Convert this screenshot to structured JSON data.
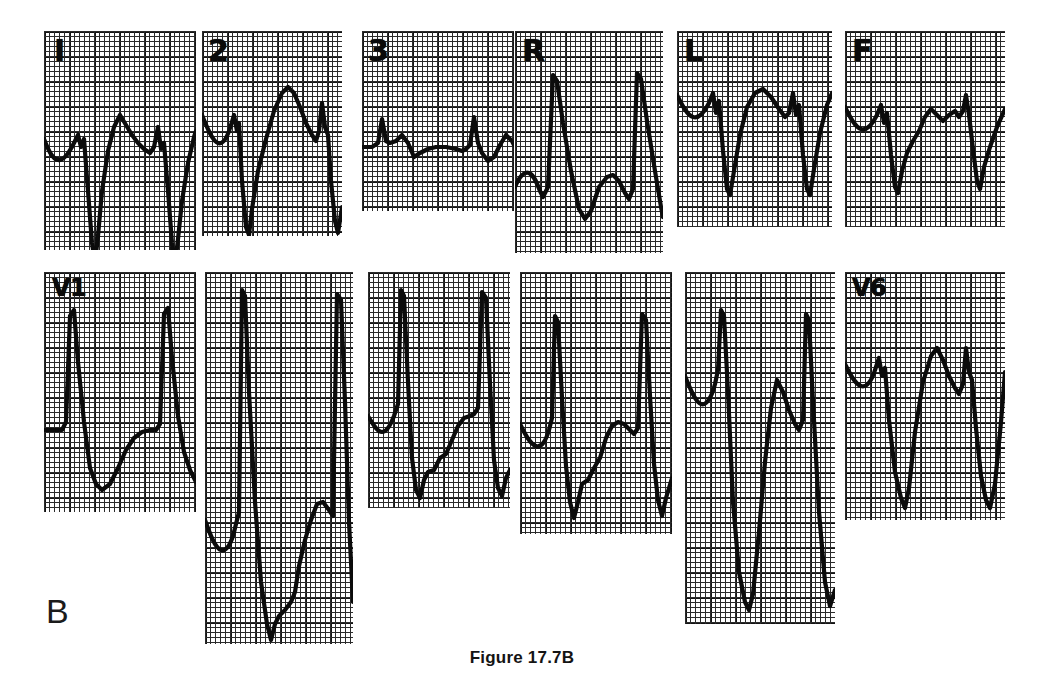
{
  "figure": {
    "caption": "Figure 17.7B",
    "panel_letter": "B",
    "kind": "12-lead electrocardiogram",
    "background_color": "#ffffff",
    "trace_color": "#0b0b0b",
    "grid_fine_color": "#1a1a1a",
    "grid_bold_color": "#000000"
  },
  "leads": [
    {
      "name": "lead-I",
      "label": "I",
      "label_size": "big",
      "row": "limb",
      "x": 44,
      "y": 31,
      "w": 152,
      "h": 219,
      "label_x": 54,
      "label_y": 36,
      "baseline": 110,
      "description": "qR complexes with deep S, tall broad R, inverted-notched T",
      "path": "M0,108 C4,118 8,128 14,129 C20,130 26,120 30,112 L34,104 L37,116 L40,108 L44,160 L48,212 L51,232 L54,205 L58,160 L64,120 L70,96 L76,84 L82,94 L88,104 L94,112 L100,118 L106,122 L110,116 L114,96 L117,118 L120,112 L124,160 L128,212 L131,234 L134,208 L138,170 L144,132 L150,106 L152,100"
    },
    {
      "name": "lead-II",
      "label": "2",
      "label_size": "big",
      "row": "limb",
      "x": 202,
      "y": 31,
      "w": 140,
      "h": 205,
      "label_x": 208,
      "label_y": 36,
      "baseline": 100,
      "description": "broad positive R with slurred upstroke, notched T",
      "path": "M0,84 C5,96 10,110 16,112 C22,114 26,104 29,94 L32,84 L35,100 L37,92 L40,150 L44,196 L47,204 L50,178 L56,140 L64,108 L72,80 L80,62 L86,56 L92,62 L98,76 L104,92 L110,104 L114,110 L117,100 L120,72 L123,96 L126,104 L129,150 L133,190 L136,202 L140,176"
    },
    {
      "name": "lead-III",
      "label": "3",
      "label_size": "big",
      "row": "limb",
      "x": 362,
      "y": 31,
      "w": 152,
      "h": 180,
      "label_x": 368,
      "label_y": 36,
      "baseline": 116,
      "description": "low-amplitude, nearly isoelectric complexes",
      "path": "M0,116 L10,116 L16,112 L20,88 L24,110 L28,112 L34,110 L40,104 L46,112 L52,126 L58,122 L66,118 L74,116 L84,116 L94,118 L100,120 L104,118 L108,114 L112,86 L116,112 L120,122 L126,130 L132,126 L138,114 L144,104 L150,110 L152,114"
    },
    {
      "name": "lead-aVR",
      "label": "R",
      "label_size": "big",
      "row": "limb",
      "x": 515,
      "y": 31,
      "w": 148,
      "h": 222,
      "label_x": 522,
      "label_y": 36,
      "baseline": 152,
      "description": "deep negative QRS, positive P, predominantly negative deflections",
      "path": "M0,156 C4,146 9,140 14,142 C19,144 22,152 25,160 L28,166 L33,156 L38,44 L42,50 L48,92 L56,140 L64,178 L70,188 L76,180 L84,156 L92,146 L98,144 L104,150 L110,162 L114,168 L118,158 L122,42 L126,48 L132,90 L140,140 L146,176 L148,186"
    },
    {
      "name": "lead-aVL",
      "label": "L",
      "label_size": "big",
      "row": "limb",
      "x": 677,
      "y": 31,
      "w": 155,
      "h": 196,
      "label_x": 684,
      "label_y": 36,
      "baseline": 70,
      "description": "deep QS with upright notched T waves",
      "path": "M0,64 C5,74 10,84 16,86 C22,88 28,80 32,72 L36,62 L39,82 L42,70 L46,120 L50,158 L53,164 L57,140 L63,104 L70,76 L78,62 L86,58 L94,66 L102,78 L108,86 L112,82 L116,62 L119,84 L122,74 L126,124 L130,158 L133,164 L137,138 L143,102 L150,74 L155,62"
    },
    {
      "name": "lead-aVF",
      "label": "F",
      "label_size": "big",
      "row": "limb",
      "x": 845,
      "y": 31,
      "w": 160,
      "h": 196,
      "label_x": 852,
      "label_y": 36,
      "baseline": 80,
      "description": "rS complexes with notched positive T",
      "path": "M0,76 C5,86 10,96 16,98 C22,100 28,92 32,84 L36,74 L39,92 L42,82 L46,124 L50,156 L53,162 L57,140 L62,122 L68,110 L74,100 L80,86 L86,78 L92,84 L98,90 L104,84 L110,80 L114,86 L118,80 L121,64 L124,84 L128,118 L132,150 L135,158 L139,136 L145,116 L152,96 L160,78"
    },
    {
      "name": "lead-V1",
      "label": "V1",
      "label_size": "small",
      "row": "precordial",
      "x": 44,
      "y": 272,
      "w": 152,
      "h": 240,
      "label_x": 52,
      "label_y": 276,
      "baseline": 160,
      "description": "tall narrow R with very deep S, delayed repolarization",
      "path": "M0,158 L14,158 L18,158 L22,150 L26,44 L30,38 L34,90 L40,150 L46,196 L52,212 L58,218 L66,212 L74,196 L82,178 L90,166 L98,160 L106,158 L112,158 L116,152 L120,42 L124,36 L128,86 L134,144 L140,180 L146,198 L152,210"
    },
    {
      "name": "lead-V2",
      "label": "",
      "label_size": "small",
      "row": "precordial",
      "x": 205,
      "y": 272,
      "w": 148,
      "h": 372,
      "label_x": 0,
      "label_y": 0,
      "baseline": 250,
      "description": "giant S waves extending far below baseline, tall upstroke",
      "path": "M0,248 C5,262 10,276 16,278 C22,280 27,270 30,256 L34,240 L37,18 L40,24 L44,120 L50,230 L56,310 L62,352 L66,368 L70,352 L74,344 L80,338 L86,330 L90,320 L94,294 L100,268 L106,248 L112,232 L118,230 L124,238 L128,244 L132,22 L136,28 L140,130 L144,250 L148,330"
    },
    {
      "name": "lead-V3",
      "label": "",
      "label_size": "small",
      "row": "precordial",
      "x": 368,
      "y": 272,
      "w": 142,
      "h": 236,
      "label_x": 0,
      "label_y": 0,
      "baseline": 148,
      "description": "deep S with stepped ST segment and rS pattern",
      "path": "M0,144 C5,152 9,160 14,160 C19,160 23,152 26,144 L30,132 L33,18 L36,24 L40,110 L44,186 L48,218 L52,226 L56,208 L60,200 L66,198 L72,186 L78,182 L84,168 L90,154 L96,146 L102,144 L106,142 L110,136 L114,20 L118,26 L122,112 L126,188 L130,216 L134,224 L138,206 L142,198"
    },
    {
      "name": "lead-V4",
      "label": "",
      "label_size": "small",
      "row": "precordial",
      "x": 520,
      "y": 272,
      "w": 152,
      "h": 262,
      "label_x": 0,
      "label_y": 0,
      "baseline": 160,
      "description": "deep S wave with stepped recovery slope",
      "path": "M0,152 C5,162 10,172 16,174 C22,176 26,168 29,158 L32,146 L35,44 L38,50 L42,126 L46,194 L50,230 L54,246 L58,230 L62,212 L68,208 L74,196 L80,186 L86,166 L92,154 L98,150 L104,152 L110,158 L114,162 L118,156 L122,42 L126,48 L130,124 L134,192 L138,228 L142,244 L146,226 L152,206"
    },
    {
      "name": "lead-V5",
      "label": "",
      "label_size": "small",
      "row": "precordial",
      "x": 685,
      "y": 272,
      "w": 150,
      "h": 352,
      "label_x": 0,
      "label_y": 0,
      "baseline": 110,
      "description": "very deep S waves with tall notched T, wide QRS",
      "path": "M0,104 C5,116 10,130 16,132 C22,134 27,124 30,112 L33,98 L36,38 L39,44 L43,120 L48,230 L54,300 L60,330 L64,338 L68,322 L74,260 L80,190 L86,136 L92,108 L98,120 L104,138 L110,152 L114,158 L118,148 L121,42 L124,48 L128,130 L134,240 L140,310 L145,334 L150,318"
    },
    {
      "name": "lead-V6",
      "label": "V6",
      "label_size": "small",
      "row": "precordial",
      "x": 845,
      "y": 272,
      "w": 160,
      "h": 248,
      "label_x": 852,
      "label_y": 276,
      "baseline": 96,
      "description": "deep S wave with tall notched T and secondary R",
      "path": "M0,92 C5,102 10,112 16,114 C22,116 27,108 30,98 L34,86 L37,104 L40,96 L44,148 L50,200 L56,226 L60,236 L64,216 L70,160 L78,110 L86,84 L92,76 L98,88 L104,104 L110,116 L114,122 L118,112 L121,76 L124,100 L127,108 L131,156 L136,204 L141,228 L145,236 L150,212 L156,150 L160,100"
    }
  ]
}
